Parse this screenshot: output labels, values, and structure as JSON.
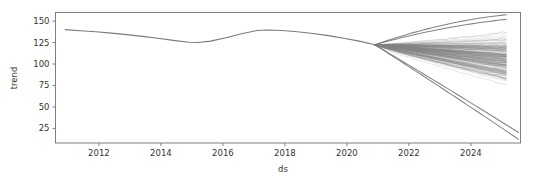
{
  "chart_data": {
    "type": "line",
    "title": "",
    "subtitle": "",
    "xlabel": "ds",
    "ylabel": "trend",
    "grid": false,
    "legend": null,
    "xlim": [
      2010.6,
      2025.6
    ],
    "ylim": [
      8,
      160
    ],
    "xticks": [
      2012,
      2014,
      2016,
      2018,
      2020,
      2024
    ],
    "xtick_labels": [
      "2012",
      "2014",
      "2016",
      "2018",
      "2020",
      "2022",
      "2024"
    ],
    "xtick_values": [
      2012,
      2014,
      2016,
      2018,
      2020,
      2022,
      2024
    ],
    "ytick_values": [
      25,
      50,
      75,
      100,
      125,
      150
    ],
    "ytick_labels": [
      "25",
      "50",
      "75",
      "100",
      "125",
      "150"
    ],
    "line_color": "#808080",
    "line_alpha": 0.28,
    "history_color": "#7a7a7a",
    "frame_color": "#7f7f7f",
    "history": {
      "name": "trend (history)",
      "x": [
        2010.9,
        2011.4,
        2011.9,
        2012.4,
        2012.9,
        2013.4,
        2013.9,
        2014.4,
        2014.9,
        2015.2,
        2015.6,
        2016.1,
        2016.6,
        2017.1,
        2017.4,
        2017.9,
        2018.4,
        2018.9,
        2019.4,
        2019.9,
        2020.4,
        2020.9
      ],
      "y": [
        140.0,
        138.8,
        137.6,
        136.0,
        134.2,
        132.2,
        130.0,
        127.6,
        125.4,
        125.0,
        126.6,
        130.6,
        135.2,
        139.0,
        139.6,
        139.0,
        137.6,
        135.6,
        133.0,
        130.0,
        126.6,
        122.4
      ]
    },
    "forecast": {
      "name": "trend (posterior samples)",
      "n_samples": 160,
      "split_x": 2020.9,
      "split_y": 122.4,
      "end_x": 2025.15,
      "band_upper_end": 157.0,
      "band_lower_end": 52.0,
      "band_dense_upper_end": 150.0,
      "band_dense_lower_end": 62.0,
      "outliers": [
        {
          "name": "upper-outlier-1",
          "end_y": 157.5,
          "curvature": 0.55
        },
        {
          "name": "upper-outlier-2",
          "end_y": 152.0,
          "curvature": 0.4
        },
        {
          "name": "lower-outlier-1",
          "end_x": 2025.55,
          "end_y": 12.0,
          "curvature": -0.1
        },
        {
          "name": "lower-outlier-2",
          "end_x": 2025.55,
          "end_y": 20.0,
          "curvature": -0.08
        }
      ]
    }
  }
}
